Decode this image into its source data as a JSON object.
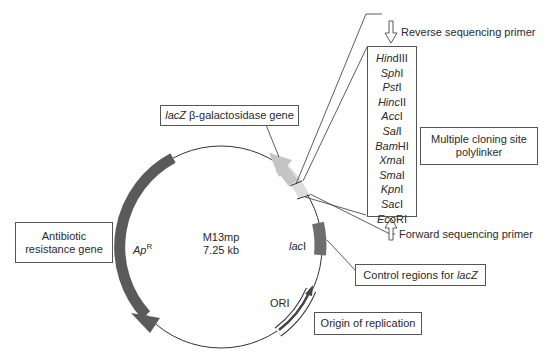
{
  "plasmid": {
    "name": "M13mp",
    "size": "7.25 kb"
  },
  "features": {
    "apr": {
      "label_main": "Ap",
      "label_sup": "R",
      "color": "#5a5a5a"
    },
    "laci": {
      "label_italic": "lac",
      "label_roman": "I",
      "color": "#6e6e6e"
    },
    "ori": {
      "label": "ORI"
    },
    "lacz": {
      "color": "#c4c4c4"
    }
  },
  "callouts": {
    "lacz_gene": {
      "italic": "lacZ",
      "rest": " β-galactosidase gene"
    },
    "antibiotic": {
      "line1": "Antibiotic",
      "line2": "resistance gene"
    },
    "mcs": {
      "line1": "Multiple cloning site",
      "line2": "polylinker"
    },
    "control": {
      "roman": "Control regions for ",
      "italic": "lacZ"
    },
    "origin": {
      "label": "Origin of replication"
    },
    "reverse_primer": {
      "label": "Reverse sequencing primer"
    },
    "forward_primer": {
      "label": "Forward sequencing primer"
    }
  },
  "polylinker_sites": [
    {
      "italic": "Hin",
      "roman": "dIII"
    },
    {
      "italic": "Sph",
      "roman": "I"
    },
    {
      "italic": "Pst",
      "roman": "I"
    },
    {
      "italic": "Hinc",
      "roman": "II"
    },
    {
      "italic": "Acc",
      "roman": "I"
    },
    {
      "italic": "Sal",
      "roman": "I"
    },
    {
      "italic": "Bam",
      "roman": "HI"
    },
    {
      "italic": "Xma",
      "roman": "I"
    },
    {
      "italic": "Sma",
      "roman": "I"
    },
    {
      "italic": "Kpn",
      "roman": "I"
    },
    {
      "italic": "Sac",
      "roman": "I"
    },
    {
      "italic": "Eco",
      "roman": "RI"
    }
  ]
}
